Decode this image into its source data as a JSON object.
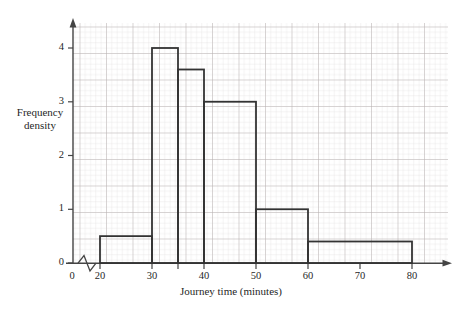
{
  "chart_data": {
    "type": "bar",
    "title": "",
    "subtitle": "",
    "xlabel": "Journey time (minutes)",
    "ylabel": "Frequency density",
    "ylabel_lines": [
      "Frequency",
      "density"
    ],
    "grid": true,
    "grid_style": "graph paper, minor 2mm, major 1cm",
    "legend": "none",
    "xlim": [
      20,
      85
    ],
    "ylim": [
      0,
      4.4
    ],
    "x_axis_break": true,
    "x_axis_break_symbol": "zigzag",
    "xticks": [
      0,
      20,
      30,
      35,
      40,
      50,
      60,
      70,
      80
    ],
    "xtick_labels": [
      "0",
      "20",
      "30",
      "40",
      "50",
      "60",
      "70",
      "80"
    ],
    "xtick_labels_shown": [
      0,
      20,
      30,
      40,
      50,
      60,
      70,
      80
    ],
    "yticks": [
      0,
      1,
      2,
      3,
      4
    ],
    "ytick_labels": [
      "0",
      "1",
      "2",
      "3",
      "4"
    ],
    "bin_edges": [
      20,
      30,
      35,
      40,
      50,
      60,
      80
    ],
    "categories": [
      "20-30",
      "30-35",
      "35-40",
      "40-50",
      "50-60",
      "60-80"
    ],
    "values": [
      0.5,
      4.0,
      3.6,
      3.0,
      1.0,
      0.4
    ],
    "bars": [
      {
        "label": "20-30",
        "x0": 20,
        "x1": 30,
        "frequency_density": 0.5,
        "frequency": 5
      },
      {
        "label": "30-35",
        "x0": 30,
        "x1": 35,
        "frequency_density": 4.0,
        "frequency": 20
      },
      {
        "label": "35-40",
        "x0": 35,
        "x1": 40,
        "frequency_density": 3.6,
        "frequency": 18
      },
      {
        "label": "40-50",
        "x0": 40,
        "x1": 50,
        "frequency_density": 3.0,
        "frequency": 30
      },
      {
        "label": "50-60",
        "x0": 50,
        "x1": 60,
        "frequency_density": 1.0,
        "frequency": 10
      },
      {
        "label": "60-80",
        "x0": 60,
        "x1": 80,
        "frequency_density": 0.4,
        "frequency": 8
      }
    ],
    "colors": {
      "bar_outline": "#333333",
      "bar_fill": "#ffffff",
      "axis": "#444444",
      "grid_minor": "#d9d4d4",
      "grid_major": "#b9b3b3",
      "text": "#1f1f1f",
      "background": "#ffffff"
    }
  }
}
